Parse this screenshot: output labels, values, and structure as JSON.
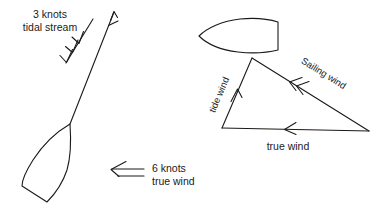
{
  "diagram": {
    "background_color": "#ffffff",
    "ink_color": "#1a1a1a",
    "labels": {
      "tidal_stream_line1": "3 knots",
      "tidal_stream_line2": "tidal stream",
      "true_wind_line1": "6 knots",
      "true_wind_line2": "true wind",
      "tide_wind": "tide wind",
      "sailing_wind": "Sailing wind",
      "true_wind_triangle": "true wind"
    },
    "left_scene": {
      "name": "boat-with-tidal-stream",
      "boat_heading_arrow": "course-arrow-up-right",
      "tidal_stream_arrow": "double-chevron-arrow-down-left",
      "true_wind_arrow": "double-line-arrow-left"
    },
    "right_scene": {
      "name": "wind-vector-triangle",
      "tide_wind_arrow": "chevron-arrow-up",
      "sailing_wind_arrow": "double-chevron-arrow-up-left",
      "true_wind_arrow": "chevron-arrow-left"
    }
  }
}
